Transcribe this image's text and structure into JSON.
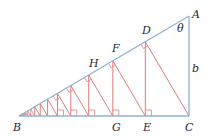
{
  "diagram": {
    "colors": {
      "triangle": "#8fb3d0",
      "construction": "#e07a7a",
      "label": "#1f2a33"
    },
    "points": {
      "A": {
        "label": "A"
      },
      "B": {
        "label": "B"
      },
      "C": {
        "label": "C"
      },
      "D": {
        "label": "D"
      },
      "E": {
        "label": "E"
      },
      "F": {
        "label": "F"
      },
      "G": {
        "label": "G"
      },
      "H": {
        "label": "H"
      }
    },
    "angle_label": "θ",
    "side_label": "b"
  }
}
